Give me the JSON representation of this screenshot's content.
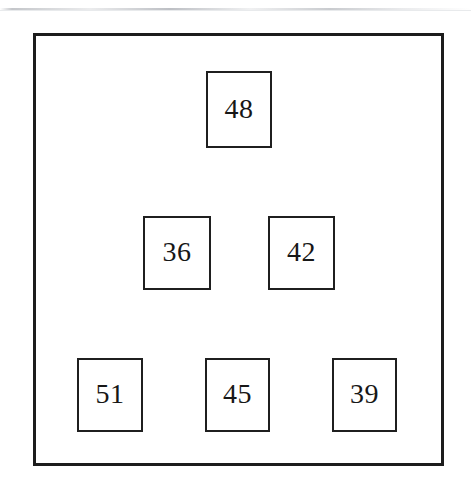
{
  "page": {
    "width": 471,
    "height": 493,
    "background_color": "#ffffff",
    "scan_artifact_color": "#b0b3b8"
  },
  "frame": {
    "name": "outer-frame",
    "x": 33,
    "y": 33,
    "width": 411,
    "height": 433,
    "border_color": "#1c1c1c",
    "border_width": 3,
    "fill_color": "#ffffff"
  },
  "diagram": {
    "type": "boxed-number-layout",
    "arrangement": "pyramid",
    "row_count": 3,
    "box_count": 6,
    "box_border_color": "#1f1f1f",
    "box_fill_color": "#ffffff",
    "text_color": "#171717",
    "boxes": [
      {
        "label": "48",
        "row": 1,
        "col": 1,
        "x": 206,
        "y": 71,
        "width": 66,
        "height": 77
      },
      {
        "label": "36",
        "row": 2,
        "col": 1,
        "x": 143,
        "y": 216,
        "width": 68,
        "height": 74
      },
      {
        "label": "42",
        "row": 2,
        "col": 2,
        "x": 268,
        "y": 216,
        "width": 67,
        "height": 74
      },
      {
        "label": "51",
        "row": 3,
        "col": 1,
        "x": 77,
        "y": 358,
        "width": 66,
        "height": 74
      },
      {
        "label": "45",
        "row": 3,
        "col": 2,
        "x": 205,
        "y": 358,
        "width": 65,
        "height": 74
      },
      {
        "label": "39",
        "row": 3,
        "col": 3,
        "x": 332,
        "y": 358,
        "width": 65,
        "height": 74
      }
    ]
  }
}
